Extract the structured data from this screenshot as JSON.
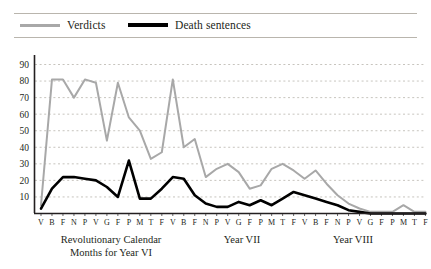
{
  "legend": {
    "items": [
      {
        "label": "Verdicts",
        "color": "#a8a8a8",
        "icon": "line-swatch-gray"
      },
      {
        "label": "Death sentences",
        "color": "#000000",
        "icon": "line-swatch-black"
      }
    ]
  },
  "axis_captions": {
    "year_vi_line1": "Revolutionary Calendar",
    "year_vi_line2": "Months for Year VI",
    "year_vii": "Year VII",
    "year_viii": "Year VIII"
  },
  "chart_data": {
    "type": "line",
    "title": "",
    "xlabel": "",
    "ylabel": "",
    "ylim": [
      0,
      90
    ],
    "yticks": [
      10,
      20,
      30,
      40,
      50,
      60,
      70,
      80,
      90
    ],
    "grid": true,
    "legend_position": "top",
    "x_tick_labels": [
      "V",
      "B",
      "F",
      "N",
      "P",
      "V",
      "G",
      "F",
      "P",
      "M",
      "T",
      "F",
      "V",
      "B",
      "F",
      "N",
      "P",
      "V",
      "G",
      "F",
      "P",
      "M",
      "T",
      "F",
      "V",
      "B",
      "F",
      "N",
      "P",
      "V",
      "G",
      "F",
      "P",
      "M",
      "T",
      "F"
    ],
    "x_groups": [
      {
        "label": "Revolutionary Calendar Months for Year VI",
        "start": 0,
        "end": 11
      },
      {
        "label": "Year VII",
        "start": 12,
        "end": 23
      },
      {
        "label": "Year VIII",
        "start": 24,
        "end": 35
      }
    ],
    "series": [
      {
        "name": "Verdicts",
        "color": "#a8a8a8",
        "values": [
          5,
          81,
          81,
          70,
          81,
          79,
          44,
          79,
          58,
          50,
          33,
          37,
          81,
          40,
          45,
          22,
          27,
          30,
          25,
          15,
          17,
          27,
          30,
          26,
          21,
          26,
          18,
          11,
          6,
          3,
          1,
          1,
          1,
          5,
          1,
          1
        ]
      },
      {
        "name": "Death sentences",
        "color": "#000000",
        "values": [
          3,
          15,
          22,
          22,
          21,
          20,
          16,
          10,
          32,
          9,
          9,
          15,
          22,
          21,
          11,
          6,
          4,
          4,
          7,
          5,
          8,
          5,
          9,
          13,
          11,
          9,
          7,
          5,
          2,
          1,
          0,
          0,
          0,
          0,
          0,
          0
        ]
      }
    ]
  }
}
